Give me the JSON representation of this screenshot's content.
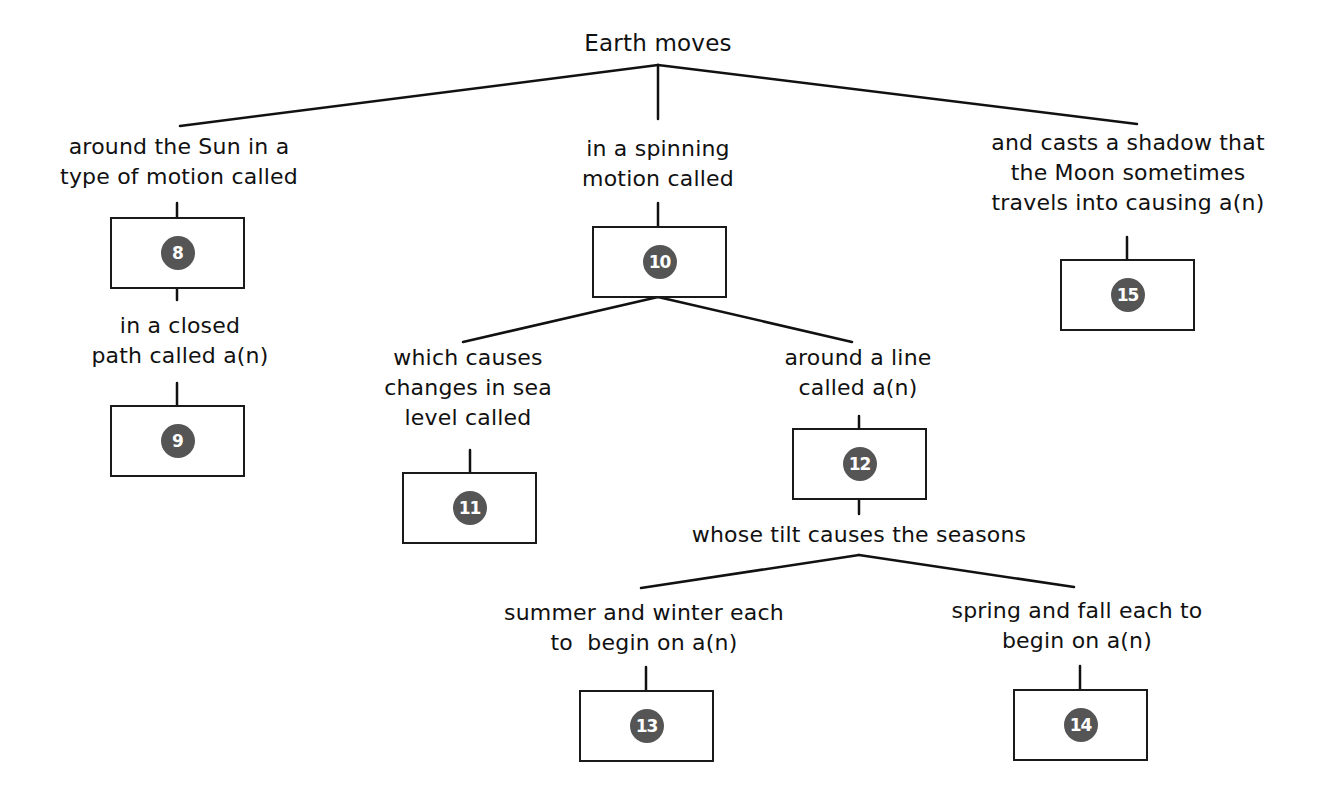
{
  "diagram": {
    "type": "concept-map",
    "root": {
      "label": "Earth moves"
    },
    "labels": {
      "around_sun": "around the Sun in a\ntype of motion called",
      "closed_path": "in a closed\npath called a(n)",
      "spinning": "in a spinning\nmotion called",
      "shadow": "and casts a shadow that\nthe Moon sometimes\ntravels into causing a(n)",
      "sea_level": "which causes\nchanges in sea\nlevel called",
      "around_line": "around a line\ncalled a(n)",
      "tilt": "whose tilt causes the seasons",
      "summer_winter": "summer and winter each\nto  begin on a(n)",
      "spring_fall": "spring and fall each to\nbegin on a(n)"
    },
    "boxes": [
      {
        "id": "box-8",
        "number": "8"
      },
      {
        "id": "box-9",
        "number": "9"
      },
      {
        "id": "box-10",
        "number": "10"
      },
      {
        "id": "box-11",
        "number": "11"
      },
      {
        "id": "box-12",
        "number": "12"
      },
      {
        "id": "box-13",
        "number": "13"
      },
      {
        "id": "box-14",
        "number": "14"
      },
      {
        "id": "box-15",
        "number": "15"
      }
    ],
    "colors": {
      "line": "#111111",
      "badge": "#555555",
      "badge_text": "#ffffff",
      "box_border": "#1a1a1a"
    }
  }
}
